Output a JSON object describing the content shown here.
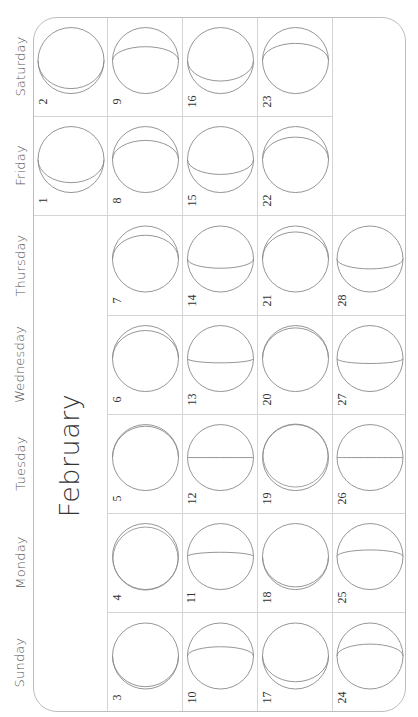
{
  "calendar": {
    "month": "February",
    "weekdays": [
      "Sunday",
      "Monday",
      "Tuesday",
      "Wednesday",
      "Thursday",
      "Friday",
      "Saturday"
    ],
    "colors": {
      "frame": "#bdbdbd",
      "grid": "#d4d4d4",
      "moon_outline": "#8a8a8a",
      "text": "#333333"
    },
    "days": [
      {
        "day": 1,
        "weekday": "Friday",
        "week": 0,
        "terminator": -0.7
      },
      {
        "day": 2,
        "weekday": "Saturday",
        "week": 0,
        "terminator": -0.85
      },
      {
        "day": 3,
        "weekday": "Sunday",
        "week": 1,
        "terminator": -0.93
      },
      {
        "day": 4,
        "weekday": "Monday",
        "week": 1,
        "terminator": -1.0
      },
      {
        "day": 5,
        "weekday": "Tuesday",
        "week": 1,
        "terminator": 0.95
      },
      {
        "day": 6,
        "weekday": "Wednesday",
        "week": 1,
        "terminator": 0.85
      },
      {
        "day": 7,
        "weekday": "Thursday",
        "week": 1,
        "terminator": 0.72
      },
      {
        "day": 8,
        "weekday": "Friday",
        "week": 1,
        "terminator": 0.58
      },
      {
        "day": 9,
        "weekday": "Saturday",
        "week": 1,
        "terminator": 0.42
      },
      {
        "day": 10,
        "weekday": "Sunday",
        "week": 2,
        "terminator": 0.28
      },
      {
        "day": 11,
        "weekday": "Monday",
        "week": 2,
        "terminator": 0.13
      },
      {
        "day": 12,
        "weekday": "Tuesday",
        "week": 2,
        "terminator": 0.0
      },
      {
        "day": 13,
        "weekday": "Wednesday",
        "week": 2,
        "terminator": -0.13
      },
      {
        "day": 14,
        "weekday": "Thursday",
        "week": 2,
        "terminator": -0.28
      },
      {
        "day": 15,
        "weekday": "Friday",
        "week": 2,
        "terminator": -0.45
      },
      {
        "day": 16,
        "weekday": "Saturday",
        "week": 2,
        "terminator": -0.62
      },
      {
        "day": 17,
        "weekday": "Sunday",
        "week": 3,
        "terminator": -0.78
      },
      {
        "day": 18,
        "weekday": "Monday",
        "week": 3,
        "terminator": -0.92
      },
      {
        "day": 19,
        "weekday": "Tuesday",
        "week": 3,
        "terminator": 1.0
      },
      {
        "day": 20,
        "weekday": "Wednesday",
        "week": 3,
        "terminator": 0.93
      },
      {
        "day": 21,
        "weekday": "Thursday",
        "week": 3,
        "terminator": 0.82
      },
      {
        "day": 22,
        "weekday": "Friday",
        "week": 3,
        "terminator": 0.68
      },
      {
        "day": 23,
        "weekday": "Saturday",
        "week": 3,
        "terminator": 0.52
      },
      {
        "day": 24,
        "weekday": "Sunday",
        "week": 4,
        "terminator": 0.36
      },
      {
        "day": 25,
        "weekday": "Monday",
        "week": 4,
        "terminator": 0.2
      },
      {
        "day": 26,
        "weekday": "Tuesday",
        "week": 4,
        "terminator": 0.0
      },
      {
        "day": 27,
        "weekday": "Wednesday",
        "week": 4,
        "terminator": -0.15
      },
      {
        "day": 28,
        "weekday": "Thursday",
        "week": 4,
        "terminator": -0.3
      }
    ]
  }
}
